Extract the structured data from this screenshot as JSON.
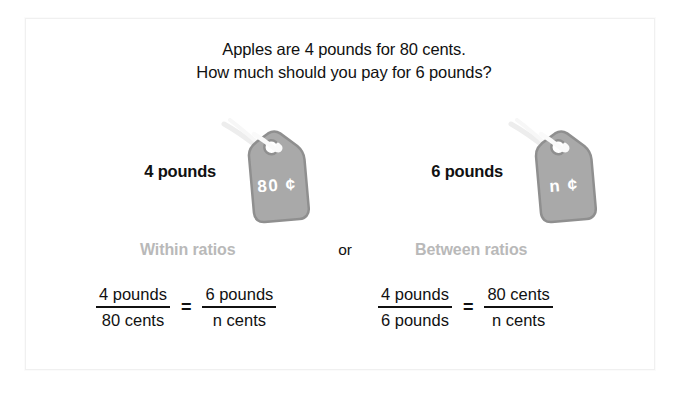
{
  "slide": {
    "prompt_line1": "Apples are 4 pounds for 80 cents.",
    "prompt_line2": "How much should you pay for 6 pounds?",
    "colors": {
      "background": "#ffffff",
      "frame_border": "#f0f0f0",
      "text": "#111111",
      "tag_fill": "#a9a9a9",
      "tag_stroke": "#8f8f8f",
      "tag_text": "#ffffff",
      "heading_gray": "#b9b9b9",
      "string": "#f2f2f2"
    }
  },
  "tags": [
    {
      "weight_label": "4 pounds",
      "tag_value": "80 ¢",
      "icon": "price-tag-icon"
    },
    {
      "weight_label": "6 pounds",
      "tag_value": "n ¢",
      "icon": "price-tag-icon"
    }
  ],
  "headings": {
    "within": "Within ratios",
    "or": "or",
    "between": "Between ratios"
  },
  "equations": [
    {
      "name": "within-ratios-equation",
      "left": {
        "numerator": "4 pounds",
        "denominator": "80 cents"
      },
      "operator": "=",
      "right": {
        "numerator": "6 pounds",
        "denominator": "n cents"
      }
    },
    {
      "name": "between-ratios-equation",
      "left": {
        "numerator": "4 pounds",
        "denominator": "6 pounds"
      },
      "operator": "=",
      "right": {
        "numerator": "80 cents",
        "denominator": "n cents"
      }
    }
  ]
}
